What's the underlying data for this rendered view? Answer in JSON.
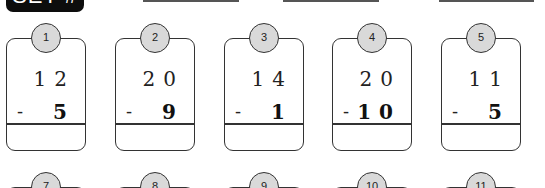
{
  "header": {
    "set_label": "SET #",
    "lines": [
      {
        "left": 143,
        "width": 96
      },
      {
        "left": 283,
        "width": 96
      },
      {
        "left": 439,
        "width": 95
      }
    ]
  },
  "problems_row1": [
    {
      "number": "1",
      "top": "12",
      "bottom": "5",
      "operator": "-"
    },
    {
      "number": "2",
      "top": "20",
      "bottom": "9",
      "operator": "-"
    },
    {
      "number": "3",
      "top": "14",
      "bottom": "1",
      "operator": "-"
    },
    {
      "number": "4",
      "top": "20",
      "bottom": "10",
      "operator": "-"
    },
    {
      "number": "5",
      "top": "11",
      "bottom": "5",
      "operator": "-"
    }
  ],
  "problems_row2": [
    {
      "number": "7"
    },
    {
      "number": "8"
    },
    {
      "number": "9"
    },
    {
      "number": "10"
    },
    {
      "number": "11"
    }
  ],
  "colors": {
    "badge_fill": "#d9d9d9",
    "label_bg": "#0d0d0d",
    "stroke": "#333333"
  }
}
